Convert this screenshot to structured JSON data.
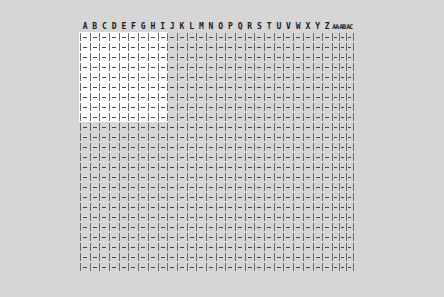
{
  "spreadsheet": {
    "columns": [
      "A",
      "B",
      "C",
      "D",
      "E",
      "F",
      "G",
      "H",
      "I",
      "J",
      "K",
      "L",
      "M",
      "N",
      "O",
      "P",
      "Q",
      "R",
      "S",
      "T",
      "U",
      "V",
      "W",
      "X",
      "Y",
      "Z",
      "AA",
      "AB",
      "AC"
    ],
    "row_count": 24,
    "empty_cell_glyph": "|—",
    "selection": {
      "start_col": "A",
      "end_col": "I",
      "start_row": 1,
      "end_row": 9,
      "color": "#ffffff"
    },
    "background_color": "#d6d6d6"
  }
}
